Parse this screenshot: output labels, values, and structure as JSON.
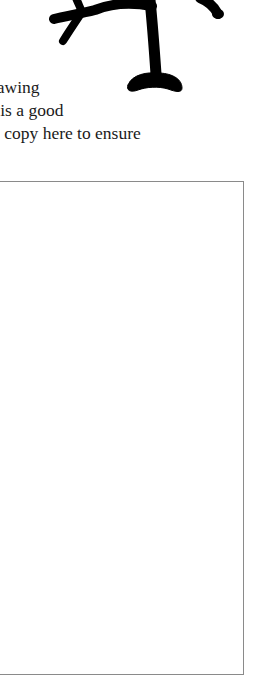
{
  "document": {
    "illustration": {
      "name": "tree-drawing",
      "color": "#000000"
    },
    "text_lines": [
      "rawing",
      "t is a good",
      "l copy here to ensure"
    ],
    "drawing_box": {
      "border_color": "#8a8a8a",
      "content": ""
    }
  }
}
